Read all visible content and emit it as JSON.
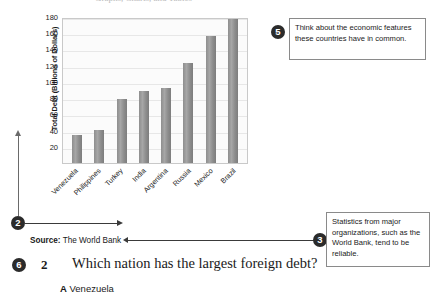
{
  "page_title_partial": "Graphs, Charts, and Tables",
  "chart_data": {
    "type": "bar",
    "title": "",
    "xlabel": "",
    "ylabel": "Total Debt (Billions of Dollars)",
    "categories": [
      "Venezuela",
      "Philippines",
      "Turkey",
      "India",
      "Argentina",
      "Russia",
      "Mexico",
      "Brazil"
    ],
    "values": [
      35,
      41,
      79,
      89,
      93,
      123,
      156,
      178
    ],
    "ylim": [
      0,
      180
    ],
    "yticks": [
      180,
      160,
      140,
      120,
      100,
      80,
      60,
      40,
      20
    ],
    "grid": true,
    "legend": "none",
    "bar_color": "#8e8e8e"
  },
  "source": {
    "label": "Source:",
    "value": "The World Bank"
  },
  "markers": {
    "m2": "2",
    "m3": "3",
    "m5": "5",
    "m6": "6"
  },
  "callouts": {
    "five": "Think about the economic features these countries have in common.",
    "three": "Statistics from major organizations, such as the World Bank, tend to be reliable."
  },
  "question": {
    "number": "2",
    "text": "Which nation has the largest foreign debt?",
    "choices": [
      {
        "letter": "A",
        "text": "Venezuela"
      }
    ]
  }
}
